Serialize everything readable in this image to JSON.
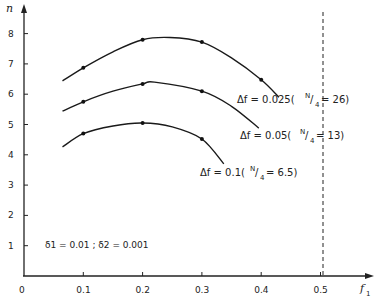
{
  "chart_data": {
    "type": "line",
    "title": "",
    "xlabel": "f1",
    "ylabel": "n",
    "xlim": [
      0,
      0.6
    ],
    "ylim": [
      0,
      9
    ],
    "grid": false,
    "x_ticks": [
      "0",
      "0.1",
      "0.2",
      "0.3",
      "0.4",
      "0.5"
    ],
    "y_ticks": [
      "1",
      "2",
      "3",
      "4",
      "5",
      "6",
      "7",
      "8"
    ],
    "vertical_reference_line": {
      "x": 0.5,
      "style": "dashed"
    },
    "parameters_text": "δ1 = 0.01 ; δ2 = 0.001",
    "series": [
      {
        "name": "Δf = 0.025 (N/4 = 26)",
        "label_main": "Δf = 0.025(",
        "label_frac_n": "N",
        "label_frac_d": "4",
        "label_tail": "= 26)",
        "marker_points": [
          [
            0.1,
            6.87
          ],
          [
            0.2,
            7.8
          ],
          [
            0.3,
            7.72
          ],
          [
            0.4,
            6.48
          ]
        ],
        "curve": [
          [
            0.065,
            6.44
          ],
          [
            0.1,
            6.87
          ],
          [
            0.15,
            7.4
          ],
          [
            0.2,
            7.8
          ],
          [
            0.246,
            7.87
          ],
          [
            0.3,
            7.72
          ],
          [
            0.35,
            7.2
          ],
          [
            0.4,
            6.48
          ],
          [
            0.43,
            5.9
          ]
        ]
      },
      {
        "name": "Δf = 0.05 (N/4 = 13)",
        "label_main": "Δf = 0.05(",
        "label_frac_n": "N",
        "label_frac_d": "4",
        "label_tail": "= 13)",
        "marker_points": [
          [
            0.1,
            5.75
          ],
          [
            0.2,
            6.34
          ],
          [
            0.3,
            6.1
          ]
        ],
        "curve": [
          [
            0.065,
            5.44
          ],
          [
            0.1,
            5.75
          ],
          [
            0.15,
            6.1
          ],
          [
            0.2,
            6.34
          ],
          [
            0.22,
            6.4
          ],
          [
            0.3,
            6.1
          ],
          [
            0.35,
            5.6
          ],
          [
            0.396,
            4.88
          ]
        ]
      },
      {
        "name": "Δf = 0.1 (N/4 = 6.5)",
        "label_main": "Δf = 0.1(",
        "label_frac_n": "N",
        "label_frac_d": "4",
        "label_tail": "= 6.5)",
        "marker_points": [
          [
            0.1,
            4.7
          ],
          [
            0.2,
            5.05
          ],
          [
            0.3,
            4.52
          ]
        ],
        "curve": [
          [
            0.065,
            4.26
          ],
          [
            0.1,
            4.7
          ],
          [
            0.15,
            4.95
          ],
          [
            0.2,
            5.05
          ],
          [
            0.25,
            4.92
          ],
          [
            0.3,
            4.52
          ],
          [
            0.337,
            3.7
          ]
        ]
      }
    ]
  }
}
